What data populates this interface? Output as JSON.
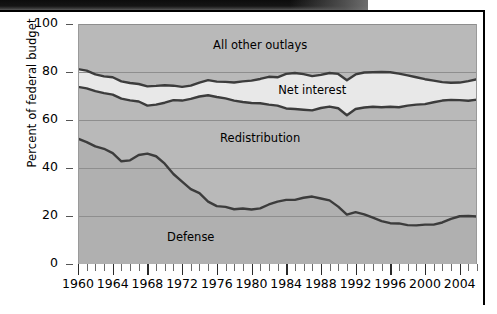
{
  "figure": {
    "top_bar": "decorative-dark-bar"
  },
  "chart_data": {
    "type": "area",
    "title": "",
    "subtitle": "",
    "xlabel": "",
    "ylabel": "Percent of federal budget",
    "xlim": [
      1960,
      2006
    ],
    "ylim": [
      0,
      100
    ],
    "grid": true,
    "grid_axis": "y",
    "legend": "inline-band-labels",
    "stacked": true,
    "y_ticks": [
      0,
      20,
      40,
      60,
      80,
      100
    ],
    "y_tick_labels": [
      "0",
      "20",
      "40",
      "60",
      "80",
      "100"
    ],
    "x_ticks_minor_step": 1,
    "x_tick_labels": [
      "1960",
      "1964",
      "1968",
      "1972",
      "1976",
      "1980",
      "1984",
      "1988",
      "1992",
      "1996",
      "2000",
      "2004"
    ],
    "x_tick_label_values": [
      1960,
      1964,
      1968,
      1972,
      1976,
      1980,
      1984,
      1988,
      1992,
      1996,
      2000,
      2004
    ],
    "band_labels": [
      {
        "text": "All other outlays",
        "x": 1981,
        "y": 91
      },
      {
        "text": "Net interest",
        "x": 1987,
        "y": 72
      },
      {
        "text": "Redistribution",
        "x": 1981,
        "y": 52
      },
      {
        "text": "Defense",
        "x": 1973,
        "y": 11
      }
    ],
    "x": [
      1960,
      1961,
      1962,
      1963,
      1964,
      1965,
      1966,
      1967,
      1968,
      1969,
      1970,
      1971,
      1972,
      1973,
      1974,
      1975,
      1976,
      1977,
      1978,
      1979,
      1980,
      1981,
      1982,
      1983,
      1984,
      1985,
      1986,
      1987,
      1988,
      1989,
      1990,
      1991,
      1992,
      1993,
      1994,
      1995,
      1996,
      1997,
      1998,
      1999,
      2000,
      2001,
      2002,
      2003,
      2004,
      2005,
      2006
    ],
    "series": [
      {
        "name": "Defense",
        "color": "#b0b0b0",
        "description": "cumulative boundary: top of Defense band",
        "values": [
          52.2,
          50.8,
          49.0,
          48.0,
          46.2,
          42.8,
          43.2,
          45.4,
          46.0,
          44.9,
          41.8,
          37.5,
          34.3,
          31.2,
          29.5,
          26.0,
          24.1,
          23.8,
          22.8,
          23.1,
          22.7,
          23.2,
          24.8,
          26.0,
          26.7,
          26.7,
          27.6,
          28.1,
          27.3,
          26.5,
          23.9,
          20.6,
          21.6,
          20.7,
          19.3,
          17.9,
          17.0,
          16.9,
          16.2,
          16.1,
          16.4,
          16.4,
          17.3,
          18.8,
          19.9,
          20.0,
          19.8
        ]
      },
      {
        "name": "Redistribution",
        "color": "#b9b9b9",
        "description": "cumulative boundary: top of Redistribution band (Defense + Redistribution)",
        "values": [
          73.8,
          73.2,
          72.0,
          71.2,
          70.6,
          68.9,
          68.2,
          67.7,
          66.0,
          66.4,
          67.2,
          68.3,
          68.1,
          68.8,
          69.8,
          70.3,
          69.6,
          69.0,
          68.1,
          67.5,
          67.1,
          67.0,
          66.4,
          66.0,
          64.8,
          64.6,
          64.3,
          64.0,
          65.0,
          65.6,
          64.9,
          62.0,
          64.6,
          65.2,
          65.5,
          65.3,
          65.5,
          65.3,
          66.0,
          66.4,
          66.6,
          67.4,
          68.1,
          68.4,
          68.3,
          68.0,
          68.5
        ]
      },
      {
        "name": "Net interest",
        "color": "#e4e4e4",
        "description": "cumulative boundary: top of Net interest band (Defense + Redistribution + Net interest)",
        "values": [
          81.2,
          80.6,
          79.0,
          78.2,
          77.8,
          76.1,
          75.4,
          75.0,
          74.0,
          74.2,
          74.5,
          74.3,
          73.8,
          74.3,
          75.6,
          76.6,
          76.0,
          75.9,
          75.6,
          76.1,
          76.4,
          77.1,
          78.0,
          77.8,
          79.2,
          79.6,
          79.1,
          78.3,
          78.8,
          79.6,
          79.2,
          76.6,
          79.0,
          79.8,
          79.9,
          80.0,
          79.9,
          79.3,
          78.6,
          77.8,
          77.0,
          76.4,
          75.8,
          75.5,
          75.6,
          76.2,
          77.0
        ]
      },
      {
        "name": "All other outlays",
        "color": "#b9b9b9",
        "description": "remaining share up to 100 percent",
        "values": [
          100,
          100,
          100,
          100,
          100,
          100,
          100,
          100,
          100,
          100,
          100,
          100,
          100,
          100,
          100,
          100,
          100,
          100,
          100,
          100,
          100,
          100,
          100,
          100,
          100,
          100,
          100,
          100,
          100,
          100,
          100,
          100,
          100,
          100,
          100,
          100,
          100,
          100,
          100,
          100,
          100,
          100,
          100,
          100,
          100,
          100,
          100
        ]
      }
    ],
    "colors": {
      "defense_band": "#b0b0b0",
      "redistribution_band": "#b9b9b9",
      "net_interest_band": "#e8e8e8",
      "all_other_band": "#b9b9b9",
      "curve_line": "#3c3c3c",
      "gridline": "#8e8e8e",
      "axis_text": "#000000"
    }
  }
}
